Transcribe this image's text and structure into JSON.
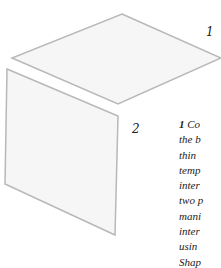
{
  "diagram": {
    "shapes": [
      {
        "id": "1",
        "name": "horizontal-panel",
        "points": "122,14 221,58 118,104 12,58",
        "fill": "#f6f6f6",
        "stroke": "#b8b8b8"
      },
      {
        "id": "2",
        "name": "vertical-panel",
        "points": "7,69 118,116 115,235 5,184",
        "fill": "#f6f6f6",
        "stroke": "#b8b8b8"
      }
    ],
    "labels": [
      {
        "text": "1",
        "x": 206,
        "y": 25
      },
      {
        "text": "2",
        "x": 132,
        "y": 122
      }
    ]
  },
  "caption": {
    "number": "1",
    "first_line": " Co",
    "lines": [
      "the b",
      "thin",
      "temp",
      "inter",
      "two p",
      "mani",
      "inter",
      "usin",
      "Shap"
    ]
  }
}
